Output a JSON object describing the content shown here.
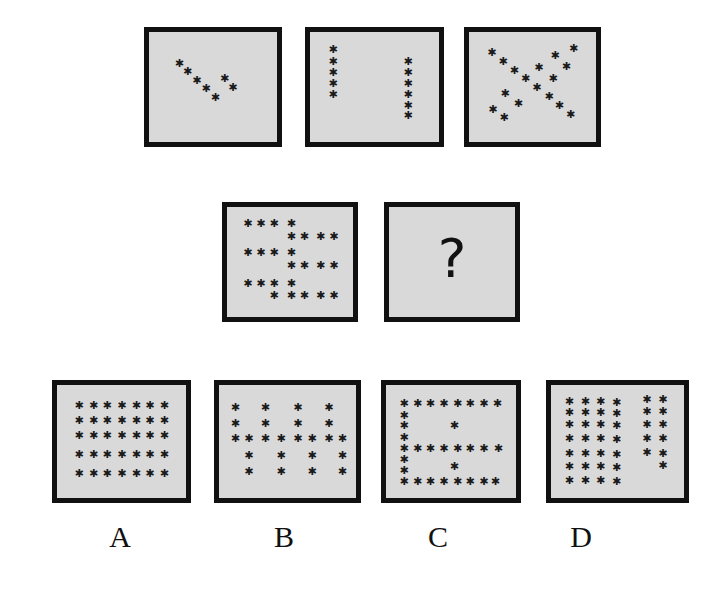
{
  "puzzle": {
    "question_mark": "?",
    "sequence": [
      {
        "id": "seq-1",
        "stars": [
          [
            0.21,
            0.3
          ],
          [
            0.29,
            0.39
          ],
          [
            0.38,
            0.49
          ],
          [
            0.47,
            0.58
          ],
          [
            0.56,
            0.68
          ],
          [
            0.65,
            0.47
          ],
          [
            0.73,
            0.57
          ]
        ]
      },
      {
        "id": "seq-2",
        "stars": [
          [
            0.14,
            0.14
          ],
          [
            0.14,
            0.27
          ],
          [
            0.14,
            0.4
          ],
          [
            0.14,
            0.52
          ],
          [
            0.14,
            0.65
          ],
          [
            0.86,
            0.27
          ],
          [
            0.86,
            0.4
          ],
          [
            0.86,
            0.52
          ],
          [
            0.86,
            0.65
          ],
          [
            0.86,
            0.77
          ],
          [
            0.86,
            0.89
          ]
        ]
      },
      {
        "id": "seq-3",
        "stars": [
          [
            0.14,
            0.17
          ],
          [
            0.25,
            0.27
          ],
          [
            0.36,
            0.37
          ],
          [
            0.47,
            0.47
          ],
          [
            0.58,
            0.57
          ],
          [
            0.7,
            0.67
          ],
          [
            0.8,
            0.77
          ],
          [
            0.91,
            0.87
          ],
          [
            0.94,
            0.13
          ],
          [
            0.76,
            0.2
          ],
          [
            0.87,
            0.33
          ],
          [
            0.6,
            0.34
          ],
          [
            0.74,
            0.47
          ],
          [
            0.27,
            0.64
          ],
          [
            0.4,
            0.75
          ],
          [
            0.15,
            0.82
          ],
          [
            0.26,
            0.91
          ]
        ]
      },
      {
        "id": "seq-4",
        "stars": [
          [
            0.12,
            0.12
          ],
          [
            0.25,
            0.12
          ],
          [
            0.38,
            0.12
          ],
          [
            0.55,
            0.12
          ],
          [
            0.55,
            0.27
          ],
          [
            0.68,
            0.27
          ],
          [
            0.84,
            0.27
          ],
          [
            0.97,
            0.27
          ],
          [
            0.12,
            0.45
          ],
          [
            0.25,
            0.45
          ],
          [
            0.38,
            0.45
          ],
          [
            0.55,
            0.45
          ],
          [
            0.55,
            0.6
          ],
          [
            0.68,
            0.6
          ],
          [
            0.84,
            0.6
          ],
          [
            0.97,
            0.6
          ],
          [
            0.12,
            0.8
          ],
          [
            0.25,
            0.8
          ],
          [
            0.38,
            0.8
          ],
          [
            0.55,
            0.8
          ],
          [
            0.38,
            0.94
          ],
          [
            0.55,
            0.94
          ],
          [
            0.68,
            0.94
          ],
          [
            0.84,
            0.94
          ],
          [
            0.97,
            0.94
          ]
        ]
      },
      {
        "id": "seq-5-unknown",
        "stars": []
      }
    ],
    "options": [
      {
        "label": "A",
        "stars": [
          [
            0.13,
            0.17
          ],
          [
            0.27,
            0.17
          ],
          [
            0.4,
            0.17
          ],
          [
            0.54,
            0.17
          ],
          [
            0.68,
            0.17
          ],
          [
            0.81,
            0.17
          ],
          [
            0.95,
            0.17
          ],
          [
            0.13,
            0.33
          ],
          [
            0.27,
            0.33
          ],
          [
            0.4,
            0.33
          ],
          [
            0.54,
            0.33
          ],
          [
            0.68,
            0.33
          ],
          [
            0.81,
            0.33
          ],
          [
            0.95,
            0.33
          ],
          [
            0.13,
            0.5
          ],
          [
            0.27,
            0.5
          ],
          [
            0.4,
            0.5
          ],
          [
            0.54,
            0.5
          ],
          [
            0.68,
            0.5
          ],
          [
            0.81,
            0.5
          ],
          [
            0.95,
            0.5
          ],
          [
            0.13,
            0.7
          ],
          [
            0.27,
            0.7
          ],
          [
            0.4,
            0.7
          ],
          [
            0.54,
            0.7
          ],
          [
            0.68,
            0.7
          ],
          [
            0.81,
            0.7
          ],
          [
            0.95,
            0.7
          ],
          [
            0.13,
            0.91
          ],
          [
            0.27,
            0.91
          ],
          [
            0.4,
            0.91
          ],
          [
            0.54,
            0.91
          ],
          [
            0.68,
            0.91
          ],
          [
            0.81,
            0.91
          ],
          [
            0.95,
            0.91
          ]
        ]
      },
      {
        "label": "B",
        "stars": [
          [
            0.07,
            0.19
          ],
          [
            0.34,
            0.19
          ],
          [
            0.63,
            0.19
          ],
          [
            0.91,
            0.19
          ],
          [
            0.07,
            0.36
          ],
          [
            0.34,
            0.36
          ],
          [
            0.63,
            0.36
          ],
          [
            0.91,
            0.36
          ],
          [
            0.07,
            0.53
          ],
          [
            0.19,
            0.53
          ],
          [
            0.34,
            0.53
          ],
          [
            0.48,
            0.53
          ],
          [
            0.63,
            0.53
          ],
          [
            0.76,
            0.53
          ],
          [
            0.91,
            0.53
          ],
          [
            1.03,
            0.53
          ],
          [
            0.19,
            0.71
          ],
          [
            0.48,
            0.71
          ],
          [
            0.76,
            0.71
          ],
          [
            1.03,
            0.71
          ],
          [
            0.19,
            0.89
          ],
          [
            0.48,
            0.89
          ],
          [
            0.76,
            0.89
          ],
          [
            1.03,
            0.89
          ]
        ]
      },
      {
        "label": "C",
        "stars": [
          [
            0.09,
            0.14
          ],
          [
            0.22,
            0.14
          ],
          [
            0.34,
            0.14
          ],
          [
            0.47,
            0.14
          ],
          [
            0.6,
            0.14
          ],
          [
            0.72,
            0.14
          ],
          [
            0.85,
            0.14
          ],
          [
            0.98,
            0.14
          ],
          [
            0.09,
            0.27
          ],
          [
            0.09,
            0.39
          ],
          [
            0.57,
            0.39
          ],
          [
            0.09,
            0.52
          ],
          [
            0.09,
            0.64
          ],
          [
            0.22,
            0.64
          ],
          [
            0.34,
            0.64
          ],
          [
            0.47,
            0.64
          ],
          [
            0.6,
            0.64
          ],
          [
            0.72,
            0.64
          ],
          [
            0.85,
            0.64
          ],
          [
            0.99,
            0.64
          ],
          [
            0.09,
            0.76
          ],
          [
            0.09,
            0.88
          ],
          [
            0.57,
            0.84
          ],
          [
            0.09,
            1.0
          ],
          [
            0.22,
            1.0
          ],
          [
            0.34,
            1.0
          ],
          [
            0.47,
            1.0
          ],
          [
            0.6,
            1.0
          ],
          [
            0.72,
            1.0
          ],
          [
            0.85,
            1.0
          ],
          [
            0.96,
            1.0
          ]
        ]
      },
      {
        "label": "D",
        "stars": [
          [
            0.09,
            0.12
          ],
          [
            0.24,
            0.12
          ],
          [
            0.38,
            0.12
          ],
          [
            0.53,
            0.13
          ],
          [
            0.81,
            0.1
          ],
          [
            0.96,
            0.1
          ],
          [
            0.09,
            0.24
          ],
          [
            0.24,
            0.24
          ],
          [
            0.38,
            0.24
          ],
          [
            0.53,
            0.25
          ],
          [
            0.81,
            0.23
          ],
          [
            0.96,
            0.23
          ],
          [
            0.09,
            0.37
          ],
          [
            0.24,
            0.37
          ],
          [
            0.38,
            0.37
          ],
          [
            0.53,
            0.38
          ],
          [
            0.81,
            0.37
          ],
          [
            0.96,
            0.37
          ],
          [
            0.09,
            0.53
          ],
          [
            0.24,
            0.53
          ],
          [
            0.38,
            0.53
          ],
          [
            0.53,
            0.54
          ],
          [
            0.81,
            0.53
          ],
          [
            0.96,
            0.53
          ],
          [
            0.09,
            0.69
          ],
          [
            0.24,
            0.69
          ],
          [
            0.38,
            0.69
          ],
          [
            0.53,
            0.7
          ],
          [
            0.81,
            0.68
          ],
          [
            0.96,
            0.69
          ],
          [
            0.09,
            0.84
          ],
          [
            0.24,
            0.84
          ],
          [
            0.38,
            0.84
          ],
          [
            0.53,
            0.85
          ],
          [
            0.96,
            0.82
          ],
          [
            0.09,
            0.99
          ],
          [
            0.24,
            0.99
          ],
          [
            0.38,
            0.99
          ],
          [
            0.53,
            1.0
          ]
        ]
      }
    ]
  },
  "colors": {
    "panel_fill": "#d9d9d9",
    "panel_border": "#111111",
    "star": "#1a1a1a",
    "background": "#ffffff"
  }
}
